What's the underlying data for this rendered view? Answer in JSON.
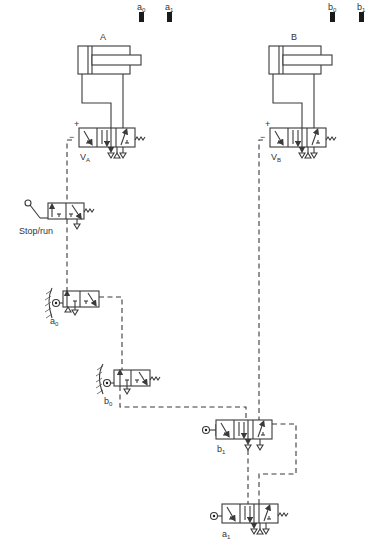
{
  "diagram": {
    "type": "pneumatic-circuit",
    "cylinders": [
      {
        "id": "A",
        "label": "A",
        "sensors": [
          {
            "label": "a",
            "sub": "0"
          },
          {
            "label": "a",
            "sub": "1"
          }
        ]
      },
      {
        "id": "B",
        "label": "B",
        "sensors": [
          {
            "label": "b",
            "sub": "0"
          },
          {
            "label": "b",
            "sub": "1"
          }
        ]
      }
    ],
    "valves": {
      "va": {
        "label": "V",
        "sub": "A",
        "plus": "+",
        "minus": "−",
        "spring": "w"
      },
      "vb": {
        "label": "V",
        "sub": "B",
        "plus": "+",
        "minus": "−",
        "spring": "w"
      },
      "stop_run": {
        "label": "Stop/run",
        "spring": "w"
      },
      "a0": {
        "label": "a",
        "sub": "0"
      },
      "b0": {
        "label": "b",
        "sub": "0",
        "spring": "w"
      },
      "b1": {
        "label": "b",
        "sub": "1"
      },
      "a1": {
        "label": "a",
        "sub": "1",
        "spring": "w"
      }
    },
    "colors": {
      "line": "#3a3a3a",
      "sensor": "#1a1a1a",
      "background": "#ffffff"
    }
  }
}
